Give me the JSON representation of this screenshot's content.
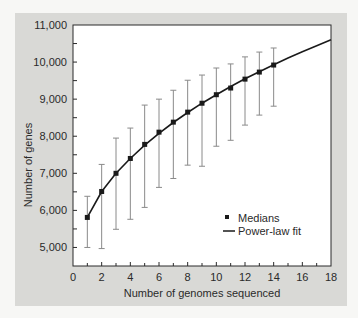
{
  "chart_data": {
    "type": "line",
    "title": "",
    "xlabel": "Number of genomes sequenced",
    "ylabel": "Number of genes",
    "xlim": [
      0,
      18
    ],
    "ylim": [
      4500,
      11000
    ],
    "x_ticks": [
      0,
      2,
      4,
      6,
      8,
      10,
      12,
      14,
      16,
      18
    ],
    "x_tick_labels": [
      "0",
      "2",
      "4",
      "6",
      "8",
      "10",
      "12",
      "14",
      "16",
      "18"
    ],
    "x_minor_ticks": [
      1,
      3,
      5,
      7,
      9,
      11,
      13,
      15,
      17
    ],
    "y_ticks": [
      5000,
      6000,
      7000,
      8000,
      9000,
      10000,
      11000
    ],
    "y_tick_labels": [
      "5,000",
      "6,000",
      "7,000",
      "8,000",
      "9,000",
      "10,000",
      "11,000"
    ],
    "y_minor_ticks": [
      5500,
      6500,
      7500,
      8500,
      9500,
      10500
    ],
    "grid": false,
    "legend_position": "lower right",
    "series": [
      {
        "name": "Medians",
        "kind": "scatter-with-errorbars",
        "marker": "square",
        "x": [
          1,
          2,
          3,
          4,
          5,
          6,
          7,
          8,
          9,
          10,
          11,
          12,
          13,
          14
        ],
        "values": [
          5810,
          6510,
          7000,
          7400,
          7780,
          8110,
          8380,
          8650,
          8890,
          9120,
          9300,
          9540,
          9730,
          9920
        ],
        "error_high": [
          6380,
          7240,
          7950,
          8220,
          8840,
          9000,
          9240,
          9510,
          9650,
          9840,
          9950,
          10140,
          10270,
          10380
        ],
        "error_low": [
          5000,
          4970,
          5490,
          5760,
          6080,
          6620,
          6860,
          7220,
          7190,
          7730,
          7890,
          8300,
          8570,
          8810
        ]
      },
      {
        "name": "Power-law fit",
        "kind": "line",
        "x": [
          1,
          2,
          3,
          4,
          5,
          6,
          7,
          8,
          9,
          10,
          11,
          12,
          13,
          14,
          15,
          16,
          17,
          18
        ],
        "values": [
          5810,
          6510,
          7000,
          7400,
          7760,
          8080,
          8370,
          8640,
          8890,
          9120,
          9340,
          9550,
          9740,
          9930,
          10110,
          10280,
          10440,
          10600
        ]
      }
    ],
    "colors": {
      "panel_background": "#d9d9d6",
      "plot_background": "#ffffff",
      "line": "#1a1a1a",
      "marker": "#1a1a1a",
      "error_bar": "#8a8a8a",
      "axis": "#2a2a2a"
    }
  },
  "legend": {
    "items": [
      {
        "label": "Medians",
        "symbol": "square"
      },
      {
        "label": "Power-law fit",
        "symbol": "line"
      }
    ]
  }
}
